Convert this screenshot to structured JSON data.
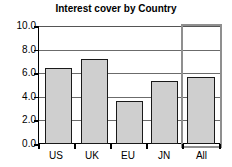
{
  "chart_data": {
    "type": "bar",
    "title": "Interest cover by Country",
    "xlabel": "",
    "ylabel": "",
    "categories": [
      "US",
      "UK",
      "EU",
      "JN",
      "All"
    ],
    "values": [
      6.4,
      7.2,
      3.6,
      5.3,
      5.6
    ],
    "series": [
      {
        "name": "Interest cover",
        "values": [
          6.4,
          7.2,
          3.6,
          5.3,
          5.6
        ]
      }
    ],
    "ylim": [
      0.0,
      10.0
    ],
    "ytick_labels": [
      "0.0",
      "2.0",
      "4.0",
      "6.0",
      "8.0",
      "10.0"
    ],
    "ytick_values": [
      0.0,
      2.0,
      4.0,
      6.0,
      8.0,
      10.0
    ],
    "grid": true,
    "legend": false,
    "legend_position": "none",
    "annotations": [
      {
        "name": "highlight-all-column",
        "category": "All",
        "description": "gray rectangle outlining the All column"
      }
    ],
    "colors": {
      "bar_fill": "#cfcfcf",
      "bar_border": "#1a1a1a",
      "gridline": "#6b6b6b",
      "axis": "#000000",
      "highlight_border": "#8f8f8f",
      "background": "#ffffff",
      "text": "#000000"
    }
  }
}
